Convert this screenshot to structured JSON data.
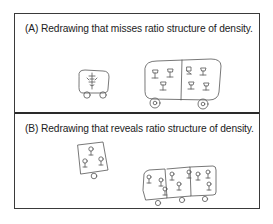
{
  "figure": {
    "panels": [
      {
        "label": "A",
        "caption": "(A) Redrawing that misses ratio structure of density.",
        "drawings": [
          {
            "name": "small-car",
            "compartments": 1,
            "figures": 1,
            "wheels": 2
          },
          {
            "name": "large-car",
            "compartments": 2,
            "figures": 6,
            "wheels": 2
          }
        ]
      },
      {
        "label": "B",
        "caption": "(B) Redrawing that reveals ratio structure of density.",
        "drawings": [
          {
            "name": "single-unit-car",
            "compartments": 1,
            "figures": 3,
            "wheels": 1
          },
          {
            "name": "triple-unit-car",
            "compartments": 3,
            "figures": 9,
            "wheels": 3
          }
        ]
      }
    ],
    "colors": {
      "border": "#3a3a3a",
      "ink": "#555555",
      "text": "#222222"
    }
  }
}
